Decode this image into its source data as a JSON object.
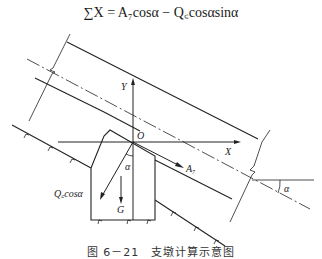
{
  "formula": {
    "text": "∑X = A₇cosα − Q꜀cosαsinα",
    "lhs": "∑X =",
    "term1": "A₇ cosα",
    "operator": "−",
    "term2": "Q꜀cosαsinα"
  },
  "diagram": {
    "axis_labels": {
      "x": "X",
      "y": "Y",
      "origin": "O"
    },
    "force_labels": {
      "thrust": "A₇",
      "gravity": "G",
      "component": "Q꜀cosα"
    },
    "angle_labels": {
      "block_angle": "α",
      "pipe_angle": "α"
    }
  },
  "caption": "图 6－21　支墩计算示意图"
}
